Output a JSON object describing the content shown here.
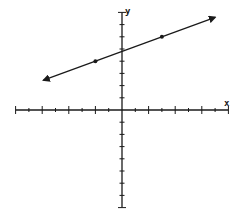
{
  "chart_data": {
    "type": "line",
    "title": "",
    "xlabel": "x",
    "ylabel": "y",
    "xlim": [
      -8,
      8
    ],
    "ylim": [
      -8,
      8
    ],
    "tick_step": 1,
    "major_tick_every": 2,
    "grid": false,
    "tick_labels_shown": false,
    "series": [
      {
        "name": "line",
        "equation": "y = 0.4x + 4.8",
        "slope": 0.4,
        "intercept": 4.8,
        "extends_both_directions": true,
        "x_range_drawn": [
          -5.9,
          7.0
        ],
        "points": [
          {
            "x": -2,
            "y": 4
          },
          {
            "x": 3,
            "y": 6
          }
        ]
      }
    ]
  },
  "colors": {
    "ink": "#1a1a1a",
    "background": "#ffffff"
  }
}
